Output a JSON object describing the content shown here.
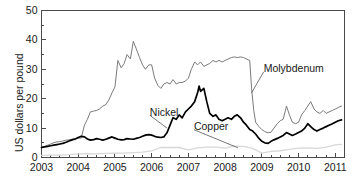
{
  "chart_data": {
    "type": "line",
    "title": "",
    "xlabel": "",
    "ylabel": "US dollars per pound",
    "xlim": [
      2003.0,
      2011.25
    ],
    "ylim": [
      0,
      50
    ],
    "grid": false,
    "legend_position": "inline-annotations",
    "xticks": [
      "2003",
      "2004",
      "2005",
      "2006",
      "2007",
      "2008",
      "2009",
      "2010",
      "2011"
    ],
    "xtick_values": [
      2003,
      2004,
      2005,
      2006,
      2007,
      2008,
      2009,
      2010,
      2011
    ],
    "x_minor_tick_interval": 0.25,
    "yticks": [
      "0",
      "10",
      "20",
      "30",
      "40",
      "50"
    ],
    "ytick_values": [
      0,
      10,
      20,
      30,
      40,
      50
    ],
    "y_minor_tick_interval": 5,
    "annotations": [
      {
        "text": "Molybdenum",
        "x": 2009.05,
        "y": 30.0,
        "leader_to_x": 2008.72,
        "leader_to_y": 22.0
      },
      {
        "text": "Nickel",
        "x": 2005.95,
        "y": 15.2,
        "leader_to_x": 2006.42,
        "leader_to_y": 10.0
      },
      {
        "text": "Copper",
        "x": 2007.15,
        "y": 10.3,
        "leader_to_x": 2008.35,
        "leader_to_y": 3.3
      }
    ],
    "series": [
      {
        "name": "Molybdenum",
        "color": "#7a7a7a",
        "width": 1.0,
        "x": [
          2003.0,
          2003.08,
          2003.17,
          2003.25,
          2003.33,
          2003.42,
          2003.5,
          2003.58,
          2003.67,
          2003.75,
          2003.83,
          2003.92,
          2004.0,
          2004.08,
          2004.17,
          2004.25,
          2004.33,
          2004.42,
          2004.5,
          2004.58,
          2004.67,
          2004.75,
          2004.83,
          2004.92,
          2005.0,
          2005.08,
          2005.17,
          2005.25,
          2005.33,
          2005.42,
          2005.5,
          2005.58,
          2005.67,
          2005.75,
          2005.83,
          2005.92,
          2006.0,
          2006.08,
          2006.17,
          2006.25,
          2006.33,
          2006.42,
          2006.5,
          2006.58,
          2006.67,
          2006.75,
          2006.83,
          2006.92,
          2007.0,
          2007.08,
          2007.17,
          2007.25,
          2007.33,
          2007.42,
          2007.5,
          2007.58,
          2007.67,
          2007.75,
          2007.83,
          2007.92,
          2008.0,
          2008.08,
          2008.17,
          2008.25,
          2008.33,
          2008.42,
          2008.5,
          2008.58,
          2008.67,
          2008.72,
          2008.78,
          2008.83,
          2008.92,
          2009.0,
          2009.08,
          2009.17,
          2009.25,
          2009.33,
          2009.42,
          2009.5,
          2009.58,
          2009.67,
          2009.75,
          2009.83,
          2009.92,
          2010.0,
          2010.08,
          2010.17,
          2010.25,
          2010.33,
          2010.42,
          2010.5,
          2010.58,
          2010.67,
          2010.75,
          2010.83,
          2010.92,
          2011.0,
          2011.08,
          2011.17
        ],
        "y": [
          3.6,
          3.7,
          4.2,
          4.6,
          5.0,
          5.3,
          5.4,
          5.6,
          5.9,
          6.0,
          6.2,
          6.4,
          6.6,
          6.6,
          11.0,
          13.0,
          15.5,
          15.8,
          16.0,
          16.5,
          17.5,
          18.0,
          19.5,
          22.0,
          24.0,
          33.0,
          30.5,
          32.0,
          35.0,
          33.5,
          39.5,
          37.0,
          34.0,
          31.5,
          30.0,
          31.5,
          31.5,
          27.0,
          24.5,
          23.5,
          25.0,
          25.5,
          25.0,
          26.5,
          25.0,
          25.5,
          25.5,
          26.0,
          27.0,
          30.0,
          32.5,
          31.5,
          32.5,
          31.0,
          31.5,
          32.0,
          33.0,
          32.5,
          33.0,
          32.5,
          33.0,
          33.5,
          34.0,
          34.2,
          34.0,
          34.2,
          34.0,
          33.5,
          33.0,
          23.5,
          16.0,
          12.0,
          10.5,
          9.5,
          8.8,
          8.4,
          8.6,
          10.0,
          11.5,
          12.5,
          13.0,
          17.5,
          14.5,
          12.0,
          11.5,
          12.0,
          14.5,
          16.0,
          17.5,
          19.0,
          16.5,
          15.5,
          15.0,
          16.0,
          15.0,
          15.5,
          16.0,
          16.5,
          17.0,
          17.5
        ]
      },
      {
        "name": "Nickel",
        "color": "#000000",
        "width": 1.7,
        "x": [
          2003.0,
          2003.08,
          2003.17,
          2003.25,
          2003.33,
          2003.42,
          2003.5,
          2003.58,
          2003.67,
          2003.75,
          2003.83,
          2003.92,
          2004.0,
          2004.08,
          2004.17,
          2004.25,
          2004.33,
          2004.42,
          2004.5,
          2004.58,
          2004.67,
          2004.75,
          2004.83,
          2004.92,
          2005.0,
          2005.08,
          2005.17,
          2005.25,
          2005.33,
          2005.42,
          2005.5,
          2005.58,
          2005.67,
          2005.75,
          2005.83,
          2005.92,
          2006.0,
          2006.08,
          2006.17,
          2006.25,
          2006.33,
          2006.42,
          2006.5,
          2006.58,
          2006.67,
          2006.75,
          2006.83,
          2006.92,
          2007.0,
          2007.08,
          2007.17,
          2007.25,
          2007.29,
          2007.33,
          2007.42,
          2007.5,
          2007.58,
          2007.67,
          2007.75,
          2007.83,
          2007.92,
          2008.0,
          2008.08,
          2008.17,
          2008.25,
          2008.33,
          2008.42,
          2008.5,
          2008.58,
          2008.67,
          2008.75,
          2008.83,
          2008.92,
          2009.0,
          2009.08,
          2009.17,
          2009.25,
          2009.33,
          2009.42,
          2009.5,
          2009.58,
          2009.67,
          2009.75,
          2009.83,
          2009.92,
          2010.0,
          2010.08,
          2010.17,
          2010.25,
          2010.33,
          2010.42,
          2010.5,
          2010.58,
          2010.67,
          2010.75,
          2010.83,
          2010.92,
          2011.0,
          2011.08,
          2011.17
        ],
        "y": [
          3.4,
          3.6,
          3.8,
          4.0,
          4.2,
          4.4,
          4.6,
          4.8,
          5.2,
          5.6,
          6.0,
          6.3,
          6.8,
          7.2,
          7.0,
          6.3,
          5.9,
          6.1,
          6.4,
          6.2,
          5.9,
          6.2,
          6.6,
          7.0,
          6.6,
          6.2,
          6.0,
          6.1,
          6.4,
          6.3,
          6.2,
          6.5,
          6.8,
          7.2,
          7.6,
          7.8,
          7.6,
          7.2,
          6.9,
          6.8,
          7.0,
          8.5,
          11.0,
          13.5,
          13.0,
          14.5,
          13.5,
          15.5,
          16.5,
          17.5,
          19.0,
          22.0,
          24.3,
          22.5,
          23.5,
          19.0,
          15.0,
          14.0,
          14.5,
          13.0,
          12.5,
          13.0,
          13.5,
          13.0,
          14.0,
          14.5,
          13.5,
          12.0,
          11.0,
          9.5,
          9.0,
          8.0,
          6.5,
          5.5,
          5.0,
          4.8,
          5.5,
          6.0,
          6.5,
          7.0,
          7.5,
          8.5,
          8.0,
          7.5,
          8.0,
          8.5,
          9.0,
          10.0,
          11.5,
          10.5,
          9.5,
          9.0,
          9.5,
          10.0,
          10.5,
          11.0,
          11.5,
          12.0,
          12.5,
          12.8
        ]
      },
      {
        "name": "Copper",
        "color": "#d8d8d8",
        "width": 1.3,
        "x": [
          2003.0,
          2003.25,
          2003.5,
          2003.75,
          2004.0,
          2004.25,
          2004.5,
          2004.75,
          2005.0,
          2005.25,
          2005.5,
          2005.75,
          2006.0,
          2006.25,
          2006.5,
          2006.75,
          2007.0,
          2007.25,
          2007.5,
          2007.75,
          2008.0,
          2008.25,
          2008.5,
          2008.75,
          2009.0,
          2009.25,
          2009.5,
          2009.75,
          2010.0,
          2010.25,
          2010.5,
          2010.75,
          2011.0,
          2011.17
        ],
        "y": [
          0.75,
          0.78,
          0.8,
          0.95,
          1.25,
          1.3,
          1.25,
          1.4,
          1.45,
          1.5,
          1.65,
          1.85,
          2.25,
          3.4,
          3.45,
          3.4,
          2.6,
          3.3,
          3.5,
          3.55,
          3.2,
          3.85,
          3.75,
          3.1,
          1.5,
          2.1,
          2.3,
          2.8,
          3.2,
          3.3,
          3.1,
          3.5,
          4.3,
          4.45
        ]
      }
    ]
  }
}
